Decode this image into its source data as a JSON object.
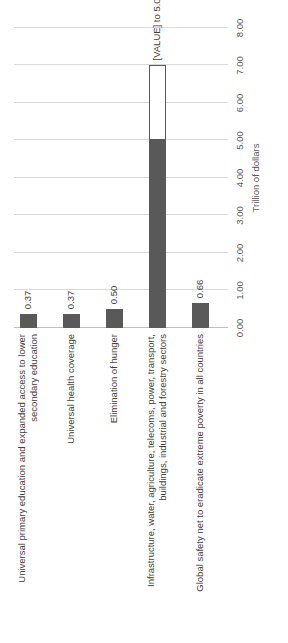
{
  "chart_data": {
    "type": "bar",
    "orientation": "horizontal",
    "title": "",
    "subtitle": "",
    "xlabel": "Trillion of dollars",
    "ylabel": "",
    "xlim": [
      0.0,
      8.0
    ],
    "xtick_step": 1.0,
    "xticks": [
      "0.00",
      "1.00",
      "2.00",
      "3.00",
      "4.00",
      "5.00",
      "6.00",
      "7.00",
      "8.00"
    ],
    "xtick_values": [
      0,
      1,
      2,
      3,
      4,
      5,
      6,
      7,
      8
    ],
    "grid": true,
    "legend": "none",
    "categories": [
      "Universal primary education and expanded access to lower secondary education",
      "Universal health coverage",
      "Elimination of hunger",
      "Infrastructure, water, agriculture, telecoms, power, transport, buildings, industrial and forestry sectors",
      "Global safety net to eradicate extreme poverty in all countries"
    ],
    "values": [
      0.37,
      0.37,
      0.5,
      5.0,
      0.66
    ],
    "value_labels": [
      "0.37",
      "0.37",
      "0.50",
      "[VALUE] to 5.00",
      "0.66"
    ],
    "range_bars": [
      {
        "category_index": 3,
        "from": 5.0,
        "to": 7.0,
        "style": "outline",
        "label": "[VALUE] to 5.00"
      }
    ],
    "colors": {
      "bar": "#595959",
      "bar_open_fill": "#FFFFFF",
      "bar_open_border": "#595959",
      "gridline": "#D9D9D9",
      "axis": "#BFBFBF",
      "text": "#404040",
      "tick_text": "#595959",
      "background": "#FFFFFF"
    }
  },
  "bars": [
    {
      "label": "Universal primary education and expanded access to lower secondary education",
      "value": 0.37,
      "value_label": "0.37",
      "range_to": null,
      "range_label": null
    },
    {
      "label": "Universal health coverage",
      "value": 0.37,
      "value_label": "0.37",
      "range_to": null,
      "range_label": null
    },
    {
      "label": "Elimination of hunger",
      "value": 0.5,
      "value_label": "0.50",
      "range_to": null,
      "range_label": null
    },
    {
      "label": "Infrastructure, water, agriculture, telecoms, power, transport, buildings, industrial and forestry sectors",
      "value": 5.0,
      "value_label": "[VALUE] to 5.00",
      "range_to": 7.0,
      "range_label": "[VALUE] to 5.00"
    },
    {
      "label": "Global safety net to eradicate extreme poverty in all countries",
      "value": 0.66,
      "value_label": "0.66",
      "range_to": null,
      "range_label": null
    }
  ],
  "axis": {
    "title": "Trillion of dollars",
    "ticks": [
      "0.00",
      "1.00",
      "2.00",
      "3.00",
      "4.00",
      "5.00",
      "6.00",
      "7.00",
      "8.00"
    ]
  }
}
